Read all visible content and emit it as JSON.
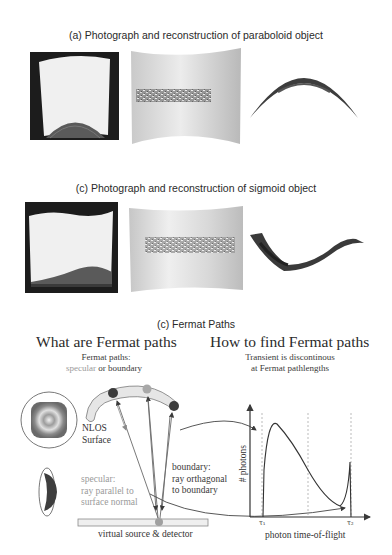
{
  "figure": {
    "panel_a": {
      "caption": "(a) Photograph and reconstruction of paraboloid object",
      "images": [
        "photograph",
        "reconstruction-surface",
        "reconstruction-profile"
      ]
    },
    "panel_c_sigmoid": {
      "caption": "(c) Photograph and reconstruction of sigmoid object",
      "images": [
        "photograph",
        "reconstruction-surface",
        "reconstruction-profile"
      ]
    },
    "panel_c_fermat": {
      "caption": "(c) Fermat Paths",
      "left": {
        "title": "What are Fermat paths",
        "subtitle_line1": "Fermat paths:",
        "subtitle_specular": "specular",
        "subtitle_or": " or ",
        "subtitle_boundary": "boundary",
        "nlos_label_line1": "NLOS",
        "nlos_label_line2": "Surface",
        "specular_label_line1": "specular:",
        "specular_label_line2": "ray parallel to",
        "specular_label_line3": "surface normal",
        "boundary_label_line1": "boundary:",
        "boundary_label_line2": "ray orthagonal",
        "boundary_label_line3": "to boundary",
        "detector_label": "virtual source & detector"
      },
      "right": {
        "title": "How to find Fermat paths",
        "subtitle_line1": "Transient is discontinous",
        "subtitle_line2": "at Fermat pathlengths",
        "y_axis_label": "# photons",
        "x_axis_label": "photon time-of-flight",
        "tick_tau1": "τ₁",
        "tick_tau2": "τ₂"
      }
    },
    "colors": {
      "specular_text": "#9a9a9a",
      "boundary_text": "#3a3a3a",
      "surface_fill": "#e6e6e6",
      "dark_point": "#3c3c3c",
      "light_point": "#a8a8a8"
    }
  }
}
